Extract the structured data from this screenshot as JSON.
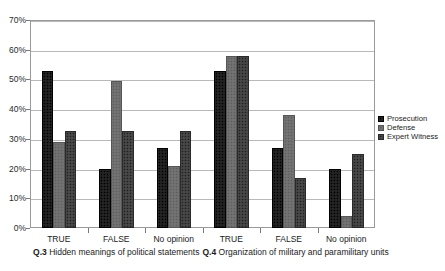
{
  "chart_data": {
    "type": "bar",
    "title": "",
    "xlabel": "",
    "ylabel": "",
    "ylim": [
      0,
      70
    ],
    "ytick_labels": [
      "0%",
      "10%",
      "20%",
      "30%",
      "40%",
      "50%",
      "60%",
      "70%"
    ],
    "ytick_values": [
      0,
      10,
      20,
      30,
      40,
      50,
      60,
      70
    ],
    "grid": true,
    "legend_position": "right",
    "categories": [
      "TRUE",
      "FALSE",
      "No opinion",
      "TRUE",
      "FALSE",
      "No opinion"
    ],
    "group_labels": [
      {
        "prefix": "Q.3",
        "text": "Hidden meanings of political statements"
      },
      {
        "prefix": "Q.4",
        "text": "Organization of military and paramilitary units"
      }
    ],
    "series": [
      {
        "name": "Prosecution",
        "color": "#1c1c1c",
        "values": [
          53,
          20,
          27,
          53,
          27,
          20
        ]
      },
      {
        "name": "Defense",
        "color": "#6e6e6e",
        "values": [
          29,
          49.5,
          21,
          58,
          38,
          4
        ]
      },
      {
        "name": "Expert Witness",
        "color": "#3f3f3f",
        "values": [
          32.5,
          32.5,
          32.5,
          58,
          17,
          25
        ]
      }
    ]
  },
  "legend": {
    "items": [
      {
        "label": "Prosecution"
      },
      {
        "label": "Defense"
      },
      {
        "label": "Expert Witness"
      }
    ]
  },
  "axis": {
    "y_labels": [
      "70%",
      "60%",
      "50%",
      "40%",
      "30%",
      "20%",
      "10%",
      "0%"
    ],
    "x_labels": [
      "TRUE",
      "FALSE",
      "No opinion",
      "TRUE",
      "FALSE",
      "No opinion"
    ]
  },
  "groups": [
    {
      "prefix": "Q.3",
      "title": "Hidden meanings of political statements"
    },
    {
      "prefix": "Q.4",
      "title": "Organization of military and paramilitary units"
    }
  ]
}
